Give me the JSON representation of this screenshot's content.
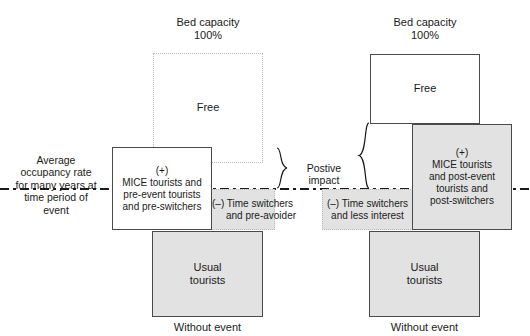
{
  "diagram": {
    "title_left": "Bed capacity\n100%",
    "axis_label": "Average occupancy rate for many years at time period of event",
    "axis_label_lines": [
      "Average",
      "occupancy rate",
      "for many years at",
      "time period of",
      "event"
    ],
    "impact_label": "Postive impact",
    "left_column": {
      "header_line1": "Bed capacity",
      "header_line2": "100%",
      "free_label": "Free",
      "mice_label": "(+)\nMICE tourists and\npre-event tourists\nand pre-switchers",
      "mice_lines": [
        "(+)",
        "MICE tourists and",
        "pre-event tourists",
        "and pre-switchers"
      ],
      "negative_label": "(–) Time switchers\nand pre-avoider",
      "negative_lines": [
        "(–) Time switchers",
        "and pre-avoider"
      ],
      "usual_label": "Usual\ntourists",
      "usual_lines": [
        "Usual",
        "tourists"
      ],
      "footer": "Without event"
    },
    "right_column": {
      "header_line1": "Bed capacity",
      "header_line2": "100%",
      "free_label": "Free",
      "mice_label": "(+)\nMICE tourists\nand post-event\ntourists and\npost-switchers",
      "mice_lines": [
        "(+)",
        "MICE tourists",
        "and post-event",
        "tourists and",
        "post-switchers"
      ],
      "negative_label": "(–) Time switchers\nand less interest",
      "negative_lines": [
        "(–) Time switchers",
        "and less interest"
      ],
      "usual_label": "Usual\ntourists",
      "usual_lines": [
        "Usual",
        "tourists"
      ],
      "footer": "Without event"
    },
    "colors": {
      "fill_gray": "#e2e2e2",
      "fill_white": "#ffffff",
      "stroke_solid": "#4a4a4a",
      "stroke_dotted": "#b9b9b9",
      "text": "#1a1a1a"
    }
  }
}
